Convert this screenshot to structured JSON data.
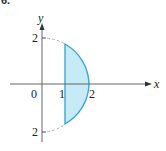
{
  "figure": {
    "number_label": "6.",
    "colors": {
      "fill": "#c6eaf6",
      "stroke": "#3aa8d4",
      "dashed_arc": "#b0b0b0",
      "axis": "#555555"
    },
    "axes": {
      "x_label": "x",
      "y_label": "y",
      "x_ticks": [
        {
          "value": 0,
          "label": "0"
        },
        {
          "value": 1,
          "label": "1"
        },
        {
          "value": 2,
          "label": "2"
        }
      ],
      "y_ticks": [
        {
          "value": 2,
          "label": "2"
        },
        {
          "value": -2,
          "label": "2"
        }
      ]
    },
    "shapes": [
      {
        "type": "circle-arc",
        "center": [
          0,
          0
        ],
        "radius": 2,
        "style": "dashed",
        "from_deg": 90,
        "to_deg": 270,
        "note": "left part shown dashed from top through x=1"
      },
      {
        "type": "shaded-segment",
        "bounded_by": [
          "x=1",
          "x^2+y^2=4"
        ],
        "x_range": [
          1,
          2
        ]
      }
    ]
  }
}
